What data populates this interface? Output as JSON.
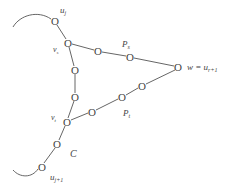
{
  "diagram": {
    "type": "graph-path-diagram",
    "labels": {
      "u_j": "u",
      "u_j_sub": "j",
      "v_s": "v",
      "v_s_sub": "s",
      "v_t": "v",
      "v_t_sub": "t",
      "P_s": "P",
      "P_s_sub": "s",
      "P_t": "P",
      "P_t_sub": "t",
      "C": "C",
      "w_eq": "w = u",
      "w_sub": "r+1",
      "u_j1": "u",
      "u_j1_sub": "j+1"
    },
    "node_glyph": "O",
    "nodes": [
      {
        "id": "u_j",
        "x": 55,
        "y": 21
      },
      {
        "id": "v_s",
        "x": 68,
        "y": 43
      },
      {
        "id": "ps1",
        "x": 98,
        "y": 51
      },
      {
        "id": "ps2",
        "x": 130,
        "y": 57
      },
      {
        "id": "w",
        "x": 178,
        "y": 67
      },
      {
        "id": "pt3",
        "x": 142,
        "y": 86
      },
      {
        "id": "pt2",
        "x": 122,
        "y": 97
      },
      {
        "id": "pt1",
        "x": 92,
        "y": 112
      },
      {
        "id": "c1",
        "x": 75,
        "y": 70
      },
      {
        "id": "c2",
        "x": 75,
        "y": 97
      },
      {
        "id": "v_t",
        "x": 67,
        "y": 122
      },
      {
        "id": "c3",
        "x": 57,
        "y": 144
      },
      {
        "id": "u_j1",
        "x": 42,
        "y": 167
      }
    ],
    "edges": [
      [
        "u_j",
        "v_s"
      ],
      [
        "v_s",
        "ps1"
      ],
      [
        "ps1",
        "ps2"
      ],
      [
        "ps2",
        "w"
      ],
      [
        "w",
        "pt3"
      ],
      [
        "pt3",
        "pt2"
      ],
      [
        "pt2",
        "pt1"
      ],
      [
        "pt1",
        "v_t"
      ],
      [
        "v_s",
        "c1"
      ],
      [
        "c1",
        "c2"
      ],
      [
        "c2",
        "v_t"
      ],
      [
        "v_t",
        "c3"
      ],
      [
        "c3",
        "u_j1"
      ]
    ]
  }
}
